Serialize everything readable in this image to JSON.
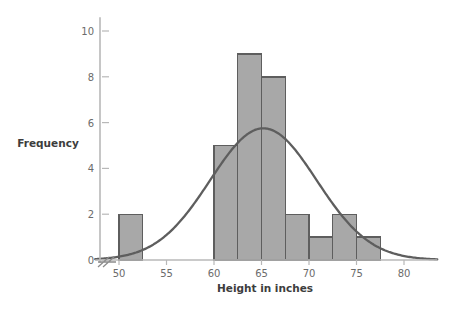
{
  "chart_data": {
    "type": "bar",
    "title": "",
    "subtitle": "",
    "xlabel": "Height in inches",
    "ylabel": "Frequency",
    "xlim": [
      47.5,
      83.5
    ],
    "ylim": [
      0,
      10.6
    ],
    "xticks": [
      50,
      55,
      60,
      65,
      70,
      75,
      80
    ],
    "xtick_labels": [
      "50",
      "55",
      "60",
      "65",
      "70",
      "75",
      "80"
    ],
    "yticks": [
      0,
      2,
      4,
      6,
      8,
      10
    ],
    "ytick_labels": [
      "0",
      "2",
      "4",
      "6",
      "8",
      "10"
    ],
    "grid": false,
    "legend": null,
    "bin_width": 2.5,
    "bins": [
      {
        "x0": 50.0,
        "x1": 52.5,
        "value": 2
      },
      {
        "x0": 60.0,
        "x1": 62.5,
        "value": 5
      },
      {
        "x0": 62.5,
        "x1": 65.0,
        "value": 9
      },
      {
        "x0": 65.0,
        "x1": 67.5,
        "value": 8
      },
      {
        "x0": 67.5,
        "x1": 70.0,
        "value": 2
      },
      {
        "x0": 70.0,
        "x1": 72.5,
        "value": 1
      },
      {
        "x0": 72.5,
        "x1": 75.0,
        "value": 2
      },
      {
        "x0": 75.0,
        "x1": 77.5,
        "value": 1
      }
    ],
    "categories": [
      "50-52.5",
      "60-62.5",
      "62.5-65",
      "65-67.5",
      "67.5-70",
      "70-72.5",
      "72.5-75",
      "75-77.5"
    ],
    "values": [
      2,
      5,
      9,
      8,
      2,
      1,
      2,
      1
    ],
    "overlay_curve": {
      "name": "normal-curve",
      "type": "line",
      "mean": 65.2,
      "sigma": 5.6,
      "peak_value": 5.75,
      "x_start": 47.5,
      "x_end": 83.5
    },
    "axis_break": true,
    "colors": {
      "bar_fill": "#a8a8a8",
      "bar_stroke": "#5e5e5e",
      "curve": "#5e5e5e",
      "axis": "#b8b8b8",
      "tick_text": "#6b6b6b",
      "label_text": "#3d3d3d",
      "background": "#ffffff"
    }
  }
}
